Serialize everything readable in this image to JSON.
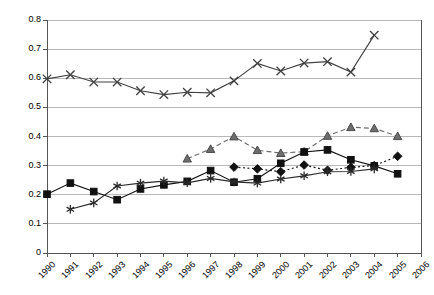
{
  "chart_data": {
    "type": "line",
    "title": "",
    "xlabel": "",
    "ylabel": "",
    "x": [
      1990,
      1991,
      1992,
      1993,
      1994,
      1995,
      1996,
      1997,
      1998,
      1999,
      2000,
      2001,
      2002,
      2003,
      2004,
      2005,
      2006
    ],
    "categories": [
      "1990",
      "1991",
      "1992",
      "1993",
      "1994",
      "1995",
      "1996",
      "1997",
      "1998",
      "1999",
      "2000",
      "2001",
      "2002",
      "2003",
      "2004",
      "2005",
      "2006"
    ],
    "xlim": [
      1990,
      2006
    ],
    "ylim": [
      0,
      0.8
    ],
    "ytick_labels": [
      "0",
      "0.1",
      "0.2",
      "0.3",
      "0.4",
      "0.5",
      "0.6",
      "0.7",
      "0.8"
    ],
    "ytick_values": [
      0,
      0.1,
      0.2,
      0.3,
      0.4,
      0.5,
      0.6,
      0.7,
      0.8
    ],
    "grid": true,
    "legend": "none",
    "series": [
      {
        "name": "series-cross",
        "marker": "x",
        "linestyle": "solid",
        "color": "#404040",
        "points": [
          {
            "x": 1990,
            "y": 0.598
          },
          {
            "x": 1991,
            "y": 0.612
          },
          {
            "x": 1992,
            "y": 0.587
          },
          {
            "x": 1993,
            "y": 0.587
          },
          {
            "x": 1994,
            "y": 0.557
          },
          {
            "x": 1995,
            "y": 0.544
          },
          {
            "x": 1996,
            "y": 0.552
          },
          {
            "x": 1997,
            "y": 0.55
          },
          {
            "x": 1998,
            "y": 0.591
          },
          {
            "x": 1999,
            "y": 0.651
          },
          {
            "x": 2000,
            "y": 0.625
          },
          {
            "x": 2001,
            "y": 0.652
          },
          {
            "x": 2002,
            "y": 0.657
          },
          {
            "x": 2003,
            "y": 0.621
          },
          {
            "x": 2004,
            "y": 0.748
          }
        ]
      },
      {
        "name": "series-triangle",
        "marker": "triangle",
        "linestyle": "dashed",
        "color": "#6e6e6e",
        "points": [
          {
            "x": 1996,
            "y": 0.324
          },
          {
            "x": 1997,
            "y": 0.357
          },
          {
            "x": 1998,
            "y": 0.4
          },
          {
            "x": 1999,
            "y": 0.353
          },
          {
            "x": 2000,
            "y": 0.343
          },
          {
            "x": 2001,
            "y": 0.348
          },
          {
            "x": 2002,
            "y": 0.402
          },
          {
            "x": 2003,
            "y": 0.432
          },
          {
            "x": 2004,
            "y": 0.428
          },
          {
            "x": 2005,
            "y": 0.401
          }
        ]
      },
      {
        "name": "series-square",
        "marker": "square",
        "linestyle": "solid",
        "color": "#111111",
        "points": [
          {
            "x": 1990,
            "y": 0.202
          },
          {
            "x": 1991,
            "y": 0.24
          },
          {
            "x": 1992,
            "y": 0.211
          },
          {
            "x": 1993,
            "y": 0.183
          },
          {
            "x": 1994,
            "y": 0.22
          },
          {
            "x": 1995,
            "y": 0.234
          },
          {
            "x": 1996,
            "y": 0.246
          },
          {
            "x": 1997,
            "y": 0.283
          },
          {
            "x": 1998,
            "y": 0.243
          },
          {
            "x": 1999,
            "y": 0.255
          },
          {
            "x": 2000,
            "y": 0.308
          },
          {
            "x": 2001,
            "y": 0.347
          },
          {
            "x": 2002,
            "y": 0.354
          },
          {
            "x": 2003,
            "y": 0.32
          },
          {
            "x": 2004,
            "y": 0.299
          },
          {
            "x": 2005,
            "y": 0.272
          }
        ]
      },
      {
        "name": "series-diamond",
        "marker": "diamond",
        "linestyle": "dotted",
        "color": "#111111",
        "points": [
          {
            "x": 1998,
            "y": 0.295
          },
          {
            "x": 1999,
            "y": 0.289
          },
          {
            "x": 2000,
            "y": 0.279
          },
          {
            "x": 2001,
            "y": 0.302
          },
          {
            "x": 2002,
            "y": 0.284
          },
          {
            "x": 2003,
            "y": 0.294
          },
          {
            "x": 2004,
            "y": 0.3
          },
          {
            "x": 2005,
            "y": 0.332
          }
        ]
      },
      {
        "name": "series-star",
        "marker": "star",
        "linestyle": "solid",
        "color": "#2b2b2b",
        "points": [
          {
            "x": 1991,
            "y": 0.15
          },
          {
            "x": 1992,
            "y": 0.172
          },
          {
            "x": 1993,
            "y": 0.23
          },
          {
            "x": 1994,
            "y": 0.24
          },
          {
            "x": 1995,
            "y": 0.247
          },
          {
            "x": 1996,
            "y": 0.241
          },
          {
            "x": 1997,
            "y": 0.256
          },
          {
            "x": 1998,
            "y": 0.244
          },
          {
            "x": 1999,
            "y": 0.24
          },
          {
            "x": 2000,
            "y": 0.254
          },
          {
            "x": 2001,
            "y": 0.265
          },
          {
            "x": 2002,
            "y": 0.279
          },
          {
            "x": 2003,
            "y": 0.28
          },
          {
            "x": 2004,
            "y": 0.289
          }
        ]
      }
    ]
  },
  "axis": {
    "left_px": 47,
    "right_px": 421,
    "top_px": 20,
    "bottom_px": 253
  },
  "colors": {
    "grid": "#b8b8b8",
    "axis": "#555555",
    "background": "#ffffff",
    "text": "#000000"
  }
}
